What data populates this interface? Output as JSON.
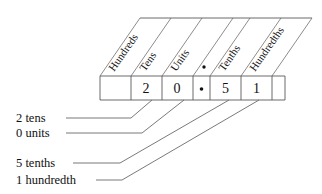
{
  "diagram": {
    "number_shown": "20.51"
  },
  "chart": {
    "headers": [
      {
        "id": "hundreds",
        "label": "Hundreds"
      },
      {
        "id": "tens",
        "label": "Tens"
      },
      {
        "id": "units",
        "label": "Units"
      },
      {
        "id": "decimal-point",
        "label": "·"
      },
      {
        "id": "tenths",
        "label": "Tenths"
      },
      {
        "id": "hundredths",
        "label": "Hundredths"
      }
    ],
    "digits": [
      {
        "id": "hundreds",
        "value": ""
      },
      {
        "id": "tens",
        "value": "2"
      },
      {
        "id": "units",
        "value": "0"
      },
      {
        "id": "decimal-point",
        "value": "·"
      },
      {
        "id": "tenths",
        "value": "5"
      },
      {
        "id": "hundredths",
        "value": "1"
      },
      {
        "id": "trailing",
        "value": ""
      }
    ]
  },
  "annotations": [
    {
      "id": "tens",
      "label": "2 tens"
    },
    {
      "id": "units",
      "label": "0 units"
    },
    {
      "id": "tenths",
      "label": "5 tenths"
    },
    {
      "id": "hundredths",
      "label": "1 hundredth"
    }
  ],
  "colors": {
    "ink": "#111111",
    "rule": "#5a5a5a",
    "leader": "#6a6a6a",
    "background": "#ffffff"
  }
}
